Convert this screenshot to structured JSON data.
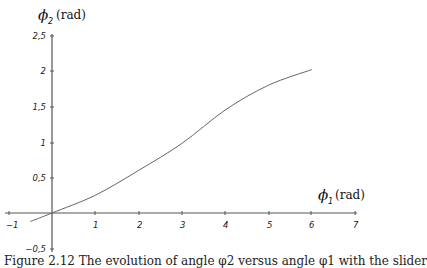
{
  "chart_data": {
    "type": "line",
    "title": "",
    "xlabel": "φ1 (rad)",
    "ylabel": "φ2 (rad)",
    "xlim": [
      -1,
      7
    ],
    "ylim": [
      -0.5,
      2.5
    ],
    "xticks": [
      "−1",
      "1",
      "2",
      "3",
      "4",
      "5",
      "6",
      "7"
    ],
    "yticks": [
      "−0,5",
      "0,5",
      "1",
      "1,5",
      "2",
      "2,5"
    ],
    "grid": false,
    "legend": null,
    "series": [
      {
        "name": "φ2(φ1)",
        "x": [
          -0.5,
          0,
          1,
          2,
          3,
          4,
          5,
          6
        ],
        "y": [
          -0.12,
          0,
          0.25,
          0.6,
          0.98,
          1.45,
          1.8,
          2.02
        ]
      }
    ]
  },
  "labels": {
    "y_phi": "ϕ",
    "y_sub": "2",
    "y_unit": "(rad)",
    "x_phi": "ϕ",
    "x_sub": "1",
    "x_unit": "(rad)"
  },
  "caption": "Figure 2.12  The evolution of angle φ2 versus angle φ1 with the slider"
}
